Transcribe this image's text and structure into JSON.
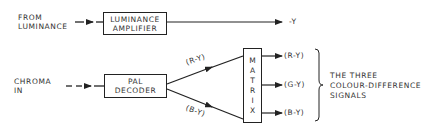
{
  "luminance_path": {
    "input_label_line1": "FROM",
    "input_label_line2": "LUMINANCE",
    "block_line1": "LUMINANCE",
    "block_line2": "AMPLIFIER",
    "output_label": "-Y"
  },
  "chroma_path": {
    "input_label_line1": "CHROMA",
    "input_label_line2": "IN",
    "decoder_line1": "PAL",
    "decoder_line2": "DECODER",
    "decoder_out_upper": "(R-Y)",
    "decoder_out_lower": "(B-Y)"
  },
  "matrix": {
    "letters": [
      "M",
      "A",
      "T",
      "R",
      "I",
      "X"
    ]
  },
  "outputs": [
    {
      "label": "(R-Y)"
    },
    {
      "label": "(G-Y)"
    },
    {
      "label": "(B-Y)"
    }
  ],
  "brace_caption": {
    "line1": "THE THREE",
    "line2": "COLOUR-DIFFERENCE",
    "line3": "SIGNALS"
  }
}
